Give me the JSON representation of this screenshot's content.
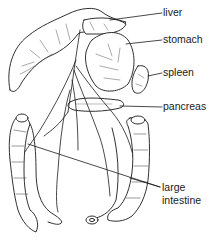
{
  "diagram": {
    "type": "anatomical-illustration",
    "labels": [
      {
        "id": "liver",
        "text": "liver"
      },
      {
        "id": "stomach",
        "text": "stomach"
      },
      {
        "id": "spleen",
        "text": "spleen"
      },
      {
        "id": "pancreas",
        "text": "pancreas"
      },
      {
        "id": "large-intestine-1",
        "text": "large"
      },
      {
        "id": "large-intestine-2",
        "text": "intestine"
      }
    ]
  },
  "colors": {
    "ink": "#1a1a1a",
    "background": "#ffffff",
    "shade": "#7a7a7a"
  }
}
